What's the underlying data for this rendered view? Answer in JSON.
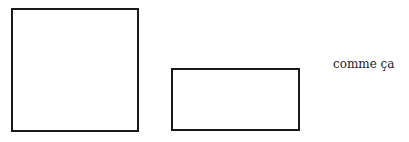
{
  "diagram": {
    "shapes": [
      {
        "type": "square",
        "label": ""
      },
      {
        "type": "rectangle",
        "label": ""
      }
    ],
    "caption": "comme ça",
    "stroke_color": "#1a1a1a"
  }
}
